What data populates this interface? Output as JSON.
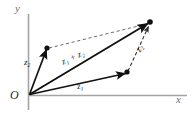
{
  "figure": {
    "type": "vector-parallelogram-diagram",
    "colors": {
      "vector": "#111111",
      "dashed": "#4a4a4a",
      "axis": "#9a9a9a",
      "axis_label": "#6f6f6f",
      "background": "#ffffff"
    },
    "axes": {
      "x_label": "x",
      "y_label": "y",
      "origin_label": "O",
      "origin": {
        "x": 29,
        "y": 95
      },
      "x_axis": {
        "x1": 29,
        "y1": 95.5,
        "x2": 187,
        "y2": 95.5
      },
      "y_axis": {
        "x1": 28.5,
        "y1": 14,
        "x2": 28.5,
        "y2": 110
      }
    },
    "points": [
      {
        "name": "origin",
        "x": 29,
        "y": 95,
        "dot": false
      },
      {
        "name": "z2-tip",
        "x": 47,
        "y": 48,
        "dot": true
      },
      {
        "name": "z1-tip",
        "x": 127,
        "y": 73,
        "dot": true
      },
      {
        "name": "sum-tip",
        "x": 150,
        "y": 22,
        "dot": true
      }
    ],
    "vectors": [
      {
        "name": "z2-from-origin",
        "label": "z",
        "sub": "2",
        "style": "solid",
        "x1": 29,
        "y1": 95,
        "x2": 47,
        "y2": 48
      },
      {
        "name": "z1-from-origin",
        "label": "z",
        "sub": "1",
        "style": "solid",
        "x1": 29,
        "y1": 95,
        "x2": 127,
        "y2": 73
      },
      {
        "name": "sum-from-origin",
        "label": "z1 + z2",
        "sub": "",
        "style": "solid",
        "x1": 29,
        "y1": 95,
        "x2": 150,
        "y2": 22
      },
      {
        "name": "z2-translated",
        "label": "z",
        "sub": "2",
        "style": "dashed",
        "x1": 127,
        "y1": 73,
        "x2": 150,
        "y2": 22
      },
      {
        "name": "z1-translated",
        "label": "",
        "sub": "",
        "style": "dashed",
        "x1": 47,
        "y1": 48,
        "x2": 150,
        "y2": 22
      }
    ],
    "labels": {
      "z2_left": {
        "base": "z",
        "sub": "2"
      },
      "z1_plus_z2": {
        "text": "z₁ + z₂"
      },
      "z2_right": {
        "base": "z",
        "sub": "2"
      },
      "z1_bottom": {
        "base": "z",
        "sub": "1"
      },
      "axis_x": "x",
      "axis_y": "y",
      "origin": "O"
    }
  }
}
